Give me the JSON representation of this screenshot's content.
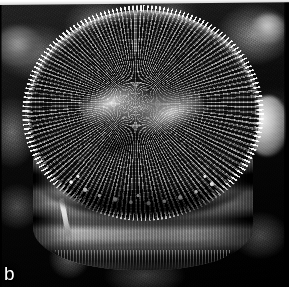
{
  "figure": {
    "panel_label": "b",
    "modality": "SEM",
    "palette": {
      "background_dark": "#0d0d0d",
      "specimen_mid": "#6f6f6f",
      "highlight": "#f2f2f2",
      "shadow": "#000000",
      "label_color": "#fdfdfd",
      "scan_edge": "#ffffff"
    },
    "regions": {
      "valve_face": "valve face with radial striae and areolae",
      "central_area": "sigmoid central depression",
      "girdle": "cylindrical girdle bands (copulae)",
      "rim": "marginal spine fringe",
      "spine": "elongate marginal spine on girdle",
      "debris_right": "out-of-focus bright particle at right",
      "substrate": "dark mottled filter substrate"
    },
    "artifacts": {
      "top_edge": "white scanned page edge strip",
      "right_edge": "dark page margin",
      "left_edge": "dark page margin"
    }
  }
}
